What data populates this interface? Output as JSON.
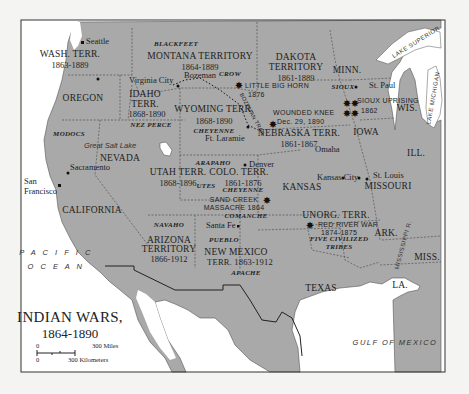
{
  "map": {
    "title": "INDIAN WARS,",
    "subtitle": "1864-1890",
    "colors": {
      "land": "#a9a9a9",
      "water": "#ffffff",
      "border": "#2a2a2a",
      "frame": "#333333",
      "outside": "#f4f4f2"
    },
    "scale": {
      "miles_zero": "0",
      "miles_label": "300 Miles",
      "km_zero": "0",
      "km_label": "300 Kilometers"
    },
    "water_bodies": {
      "pacific_1": "P A C I F I C",
      "pacific_2": "O C E A N",
      "gulf": "GULF OF MEXICO",
      "lake_superior": "LAKE SUPERIOR",
      "lake_michigan": "LAKE MICHIGAN",
      "great_salt_lake": "Great Salt Lake",
      "mississippi": "MISSISSIPPI R."
    },
    "territories": {
      "wash": {
        "name": "WASH. TERR.",
        "years": "1863-1889"
      },
      "montana": {
        "name": "MONTANA TERRITORY",
        "years": "1864-1889"
      },
      "dakota": {
        "name": "DAKOTA",
        "name2": "TERRITORY",
        "years": "1861-1889"
      },
      "idaho": {
        "name": "IDAHO",
        "name2": "TERR.",
        "years": "1868-1890"
      },
      "wyoming": {
        "name": "WYOMING TERR.",
        "years": "1868-1890"
      },
      "nebraska": {
        "name": "NEBRASKA TERR.",
        "years": "1861-1867"
      },
      "utah": {
        "name": "UTAH TERR.",
        "years": "1868-1896"
      },
      "colorado": {
        "name": "COLO. TERR.",
        "years": "1861-1876"
      },
      "arizona": {
        "name": "ARIZONA",
        "name2": "TERRITORY",
        "years": "1866-1912"
      },
      "new_mexico": {
        "name": "NEW MEXICO",
        "name2": "TERR. 1863-1912"
      },
      "unorg": {
        "name": "UNORG. TERR."
      }
    },
    "states": {
      "oregon": "OREGON",
      "nevada": "NEVADA",
      "california": "CALIFORNIA",
      "minn": "MINN.",
      "wis": "WIS.",
      "iowa": "IOWA",
      "ill": "ILL.",
      "kansas": "KANSAS",
      "missouri": "MISSOURI",
      "ark": "ARK.",
      "miss": "MISS.",
      "texas": "TEXAS",
      "la": "LA."
    },
    "tribes": {
      "blackfeet": "BLACKFEET",
      "crow": "CROW",
      "nez_perce": "NEZ PERCE",
      "modocs": "MODOCS",
      "cheyenne_wy": "CHEYENNE",
      "sioux": "SIOUX",
      "arapaho": "ARAPAHO",
      "utes": "UTES",
      "cheyenne_co": "CHEYENNE",
      "navaho": "NAVAHO",
      "comanche": "COMANCHE",
      "pueblo": "PUEBLO",
      "apache": "APACHE",
      "five_civilized_1": "FIVE CIVILIZED",
      "five_civilized_2": "TRIBES"
    },
    "battles": {
      "little_big_horn": {
        "name": "LITTLE BIG HORN",
        "year": "1876"
      },
      "wounded_knee": {
        "name": "WOUNDED KNEE",
        "date": "Dec. 29, 1890"
      },
      "sioux_uprising": {
        "name": "SIOUX UPRISING",
        "year": "1862"
      },
      "sand_creek": {
        "name": "SAND CREEK",
        "name2": "MASSACRE 1864"
      },
      "red_river": {
        "name": "RED RIVER WAR",
        "years": "1874-1875"
      }
    },
    "trails": {
      "bozeman": "BOZEMAN TRAIL"
    },
    "cities": {
      "seattle": "Seattle",
      "virginia_city": "Virginia City",
      "bozeman": "Bozeman",
      "st_paul": "St. Paul",
      "ft_laramie": "Ft. Laramie",
      "omaha": "Omaha",
      "sacramento": "Sacramento",
      "san_francisco_1": "San",
      "san_francisco_2": "Francisco",
      "denver": "Denver",
      "kansas_city": "Kansas City",
      "st_louis": "St. Louis",
      "santa_fe": "Santa Fe"
    }
  }
}
